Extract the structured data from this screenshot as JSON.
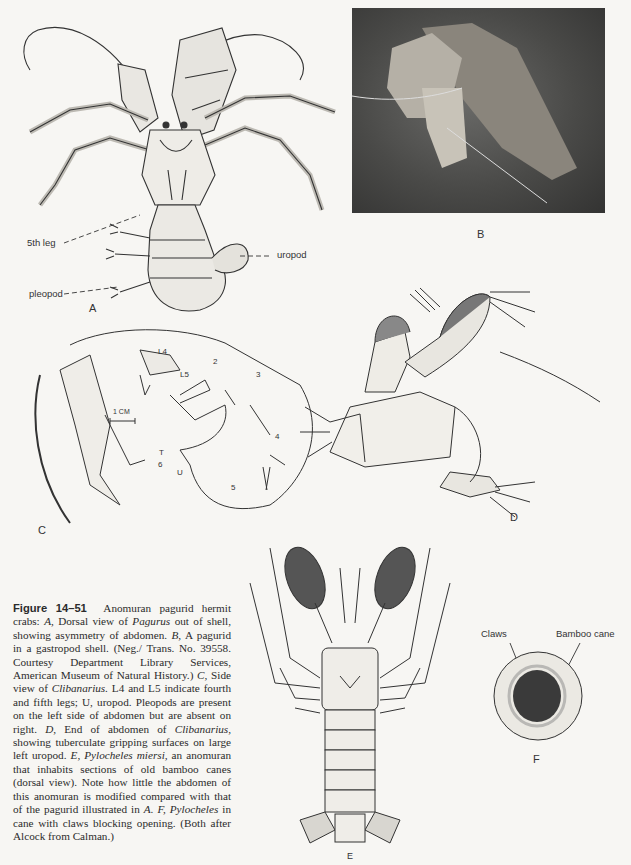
{
  "figure": {
    "number": "Figure 14–51",
    "caption_segments": [
      {
        "t": "Anomuran pagurid hermit crabs: ",
        "i": false
      },
      {
        "t": "A,",
        "i": true
      },
      {
        "t": " Dorsal view of ",
        "i": false
      },
      {
        "t": "Pagurus",
        "i": true
      },
      {
        "t": " out of shell, showing asymmetry of abdomen. ",
        "i": false
      },
      {
        "t": "B,",
        "i": true
      },
      {
        "t": " A pagurid in a gastropod shell. (Neg./ Trans. No. 39558. Courtesy Department Library Services, American Museum of Natural History.) ",
        "i": false
      },
      {
        "t": "C,",
        "i": true
      },
      {
        "t": " Side view of ",
        "i": false
      },
      {
        "t": "Clibanarius.",
        "i": true
      },
      {
        "t": " L4 and L5 indicate fourth and fifth legs; U, uropod. Pleopods are present on the left side of abdomen but are absent on right. ",
        "i": false
      },
      {
        "t": "D,",
        "i": true
      },
      {
        "t": " End of abdomen of ",
        "i": false
      },
      {
        "t": "Clibanarius,",
        "i": true
      },
      {
        "t": " showing tuberculate gripping surfaces on large left uropod. ",
        "i": false
      },
      {
        "t": "E, Pylocheles miersi,",
        "i": true
      },
      {
        "t": " an anomuran that inhabits sections of old bamboo canes (dorsal view). Note how little the abdomen of this anomuran is modified compared with that of the pagurid illustrated in ",
        "i": false
      },
      {
        "t": "A. F, Pylocheles",
        "i": true
      },
      {
        "t": " in cane with claws blocking opening. (Both after Alcock from Calman.)",
        "i": false
      }
    ]
  },
  "panels": {
    "A": {
      "label": "A",
      "callouts": {
        "fifth_leg": "5th leg",
        "uropod": "uropod",
        "pleopod": "pleopod"
      }
    },
    "B": {
      "label": "B"
    },
    "C": {
      "label": "C",
      "scale": "1 CM",
      "marks": {
        "L4": "L4",
        "L5": "L5",
        "n2": "2",
        "n3": "3",
        "n4": "4",
        "n5": "5",
        "n6": "6",
        "T": "T",
        "U": "U"
      }
    },
    "D": {
      "label": "D"
    },
    "E": {
      "label": "E"
    },
    "F": {
      "label": "F",
      "callouts": {
        "claws": "Claws",
        "bamboo_cane": "Bamboo cane"
      }
    }
  }
}
